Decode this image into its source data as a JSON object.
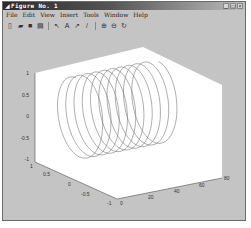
{
  "window": {
    "title": "Figure No. 1",
    "controls": {
      "minimize": "_",
      "maximize": "□",
      "close": "×"
    }
  },
  "menubar": {
    "items": [
      {
        "label": "File"
      },
      {
        "label": "Edit"
      },
      {
        "label": "View"
      },
      {
        "label": "Insert"
      },
      {
        "label": "Tools"
      },
      {
        "label": "Window"
      },
      {
        "label": "Help"
      }
    ]
  },
  "toolbar": {
    "buttons": [
      {
        "name": "new-figure",
        "glyph": "▯"
      },
      {
        "name": "open-file",
        "glyph": "▰"
      },
      {
        "name": "save",
        "glyph": "■"
      },
      {
        "name": "print",
        "glyph": "▤"
      },
      {
        "name": "edit-plot-arrow",
        "glyph": "↖"
      },
      {
        "name": "insert-text",
        "glyph": "A"
      },
      {
        "name": "insert-arrow",
        "glyph": "↗"
      },
      {
        "name": "insert-line",
        "glyph": "/"
      },
      {
        "name": "zoom-in",
        "glyph": "⊕"
      },
      {
        "name": "zoom-out",
        "glyph": "⊖"
      },
      {
        "name": "rotate-3d",
        "glyph": "↻"
      }
    ]
  },
  "chart_data": {
    "type": "line",
    "subtype": "plot3-helix",
    "title": "",
    "xlabel": "",
    "ylabel": "",
    "zlabel": "",
    "x_axis": {
      "ticks": [
        "0",
        "20",
        "40",
        "60",
        "80"
      ],
      "range": [
        0,
        80
      ]
    },
    "y_axis": {
      "ticks": [
        "-1",
        "-0.5",
        "0",
        "0.5",
        "1"
      ],
      "range": [
        -1,
        1
      ]
    },
    "z_axis": {
      "ticks": [
        "-1",
        "-0.5",
        "0",
        "0.5",
        "1"
      ],
      "range": [
        -1,
        1
      ]
    },
    "series": [
      {
        "name": "helix",
        "x": "t, 0..~63",
        "y": "sin(t)",
        "z": "cos(t)",
        "turns": 10
      }
    ],
    "grid": false,
    "legend": null
  },
  "colors": {
    "figure_bg": "#c4c4c4",
    "axes_bg": "#ffffff",
    "line": "#777777",
    "titlebar_start": "#2a2a2a"
  }
}
